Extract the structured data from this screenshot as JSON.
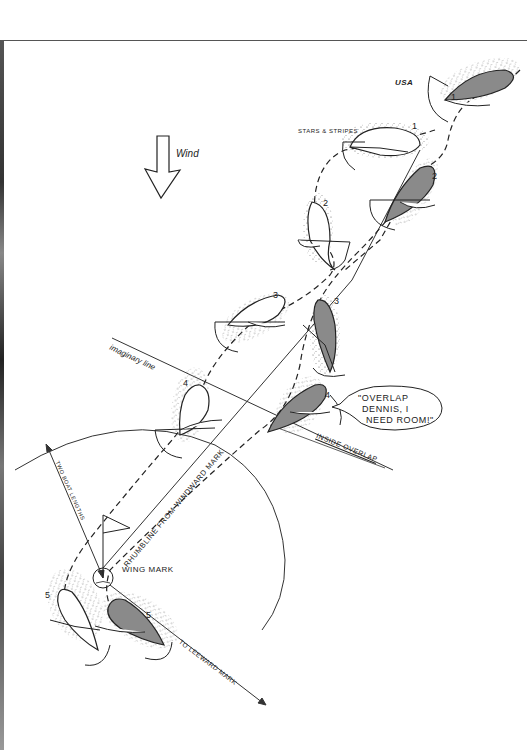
{
  "diagram": {
    "wind_label": "Wind",
    "boats": {
      "usa": {
        "label": "USA",
        "fill": "#8a8a8a"
      },
      "stars_and_stripes": {
        "label": "STARS & STRIPES",
        "fill": "#ffffff"
      }
    },
    "positions": [
      "1",
      "2",
      "3",
      "4",
      "5"
    ],
    "labels": {
      "imaginary_line": "imaginary line",
      "inside_overlap": "INSIDE OVERLAP",
      "rhumbline": "RHUMBLINE FROM WINDWARD MARK",
      "two_boat_lengths": "TWO BOAT LENGTHS",
      "wing_mark": "WING MARK",
      "to_leeward_mark": "TO LEEWARD MARK"
    },
    "speech_bubble": {
      "lines": [
        "\"OVERLAP",
        "DENNIS, I",
        "NEED ROOM!\""
      ]
    },
    "colors": {
      "ink": "#222222",
      "usa_hull": "#8a8a8a",
      "paper": "#ffffff",
      "frame": "#555555"
    }
  }
}
